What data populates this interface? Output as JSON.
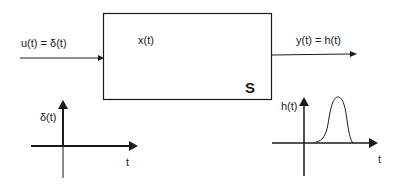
{
  "diagram": {
    "system": {
      "label": "S",
      "state_label": "x(t)"
    },
    "input": {
      "label": "u(t) = δ(t)"
    },
    "output": {
      "label": "y(t) = h(t)"
    },
    "input_plot": {
      "y_label": "δ(t)",
      "x_label": "t"
    },
    "output_plot": {
      "y_label": "h(t)",
      "x_label": "t"
    }
  },
  "colors": {
    "stroke": "#1a1a1a",
    "background": "#ffffff"
  }
}
